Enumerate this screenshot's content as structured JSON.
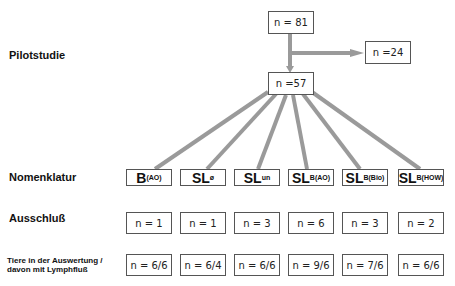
{
  "row_labels": {
    "pilot": "Pilotstudie",
    "nomenklatur": "Nomenklatur",
    "ausschluss": "Ausschluß",
    "tiere_line1": "Tiere in der Auswertung /",
    "tiere_line2": "davon mit Lymphfluß"
  },
  "flow": {
    "top": "n = 81",
    "excluded": "n =24",
    "remaining": "n =57"
  },
  "groups": [
    {
      "main": "B",
      "sub": "(AO)",
      "ausschluss": "n = 1",
      "tiere": "n = 6/6"
    },
    {
      "main": "SL",
      "sub": "ø",
      "ausschluss": "n = 1",
      "tiere": "n = 6/4"
    },
    {
      "main": "SL",
      "sub": "un",
      "ausschluss": "n = 3",
      "tiere": "n = 6/6"
    },
    {
      "main": "SL",
      "sub": "B(AO)",
      "ausschluss": "n = 6",
      "tiere": "n = 9/6"
    },
    {
      "main": "SL",
      "sub": "B(Bio)",
      "ausschluss": "n = 3",
      "tiere": "n = 7/6"
    },
    {
      "main": "SL",
      "sub": "B(HOW)",
      "ausschluss": "n = 2",
      "tiere": "n = 6/6"
    }
  ],
  "colors": {
    "connector": "#9a9a9a",
    "border": "#555555"
  }
}
